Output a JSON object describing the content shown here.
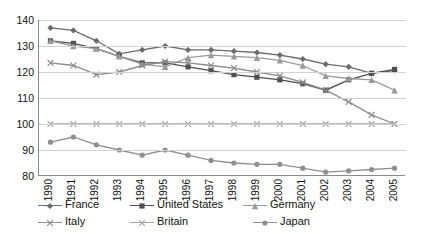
{
  "chart_data": {
    "type": "line",
    "title": "",
    "xlabel": "",
    "ylabel": "",
    "categories": [
      "1990",
      "1991",
      "1992",
      "1993",
      "1994",
      "1995",
      "1996",
      "1997",
      "1998",
      "1999",
      "2000",
      "2001",
      "2002",
      "2003",
      "2004",
      "2005"
    ],
    "ylim": [
      80,
      140
    ],
    "ytick_step": 10,
    "yticks": [
      "140",
      "130",
      "120",
      "110",
      "100",
      "90",
      "80"
    ],
    "grid": "horizontal",
    "legend_position": "bottom",
    "series": [
      {
        "name": "France",
        "color": "#6b6b6b",
        "marker": "diamond",
        "values": [
          137.0,
          136.0,
          132.0,
          127.0,
          128.5,
          130.0,
          128.5,
          128.5,
          128.0,
          127.5,
          126.5,
          125.0,
          123.0,
          122.0,
          119.5,
          120.5
        ]
      },
      {
        "name": "United States",
        "color": "#4f4f4f",
        "marker": "square",
        "values": [
          132.0,
          131.0,
          129.0,
          126.0,
          123.5,
          123.5,
          122.0,
          120.5,
          119.0,
          118.0,
          117.0,
          115.5,
          113.0,
          117.0,
          119.5,
          121.0
        ]
      },
      {
        "name": "Germany",
        "color": "#9a9a9a",
        "marker": "triangle",
        "values": [
          132.0,
          130.0,
          129.0,
          126.0,
          123.0,
          122.0,
          125.5,
          126.5,
          126.0,
          125.5,
          124.5,
          122.5,
          118.5,
          117.5,
          117.0,
          113.0
        ]
      },
      {
        "name": "Italy",
        "color": "#8c8c8c",
        "marker": "x",
        "values": [
          123.5,
          122.5,
          119.0,
          120.0,
          122.5,
          124.0,
          123.5,
          122.5,
          121.5,
          120.0,
          118.5,
          116.0,
          113.0,
          108.5,
          103.5,
          100.0
        ]
      },
      {
        "name": "Britain",
        "color": "#a5a5a5",
        "marker": "x",
        "values": [
          100.0,
          100.0,
          100.0,
          100.0,
          100.0,
          100.0,
          100.0,
          100.0,
          100.0,
          100.0,
          100.0,
          100.0,
          100.0,
          100.0,
          100.0,
          100.0
        ]
      },
      {
        "name": "Japan",
        "color": "#8f8f8f",
        "marker": "circle",
        "values": [
          93.0,
          95.0,
          92.0,
          90.0,
          88.0,
          90.0,
          88.0,
          86.0,
          85.0,
          84.5,
          84.5,
          83.0,
          81.5,
          82.0,
          82.5,
          83.0
        ]
      }
    ]
  },
  "legend": {
    "rows": [
      [
        "France",
        "United States",
        "Germany"
      ],
      [
        "Italy",
        "Britain",
        "Japan"
      ]
    ]
  }
}
